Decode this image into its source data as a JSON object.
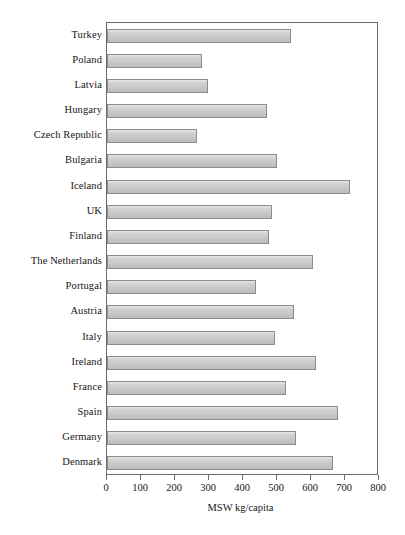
{
  "chart_data": {
    "type": "bar",
    "orientation": "horizontal",
    "title": "",
    "subtitle": "",
    "xlabel": "MSW kg/capita",
    "ylabel": "",
    "xlim": [
      0,
      800
    ],
    "xticks": [
      0,
      100,
      200,
      300,
      400,
      500,
      600,
      700,
      800
    ],
    "xtick_labels": [
      "0",
      "100",
      "200",
      "300",
      "400",
      "500",
      "600",
      "700",
      "800"
    ],
    "grid": false,
    "legend": null,
    "bar_fill_color": "#c9c9c9",
    "bar_edge_color": "#8c8c8c",
    "axis_color": "#6b6b6b",
    "categories": [
      "Turkey",
      "Poland",
      "Latvia",
      "Hungary",
      "Czech Republic",
      "Bulgaria",
      "Iceland",
      "UK",
      "Finland",
      "The Netherlands",
      "Portugal",
      "Austria",
      "Italy",
      "Ireland",
      "France",
      "Spain",
      "Germany",
      "Denmark"
    ],
    "values": [
      540,
      280,
      297,
      470,
      265,
      500,
      715,
      485,
      475,
      605,
      437,
      550,
      495,
      615,
      525,
      680,
      555,
      665
    ],
    "points": [
      {
        "category": "Turkey",
        "value": 540
      },
      {
        "category": "Poland",
        "value": 280
      },
      {
        "category": "Latvia",
        "value": 297
      },
      {
        "category": "Hungary",
        "value": 470
      },
      {
        "category": "Czech Republic",
        "value": 265
      },
      {
        "category": "Bulgaria",
        "value": 500
      },
      {
        "category": "Iceland",
        "value": 715
      },
      {
        "category": "UK",
        "value": 485
      },
      {
        "category": "Finland",
        "value": 475
      },
      {
        "category": "The Netherlands",
        "value": 605
      },
      {
        "category": "Portugal",
        "value": 437
      },
      {
        "category": "Austria",
        "value": 550
      },
      {
        "category": "Italy",
        "value": 495
      },
      {
        "category": "Ireland",
        "value": 615
      },
      {
        "category": "France",
        "value": 525
      },
      {
        "category": "Spain",
        "value": 680
      },
      {
        "category": "Germany",
        "value": 555
      },
      {
        "category": "Denmark",
        "value": 665
      }
    ]
  }
}
